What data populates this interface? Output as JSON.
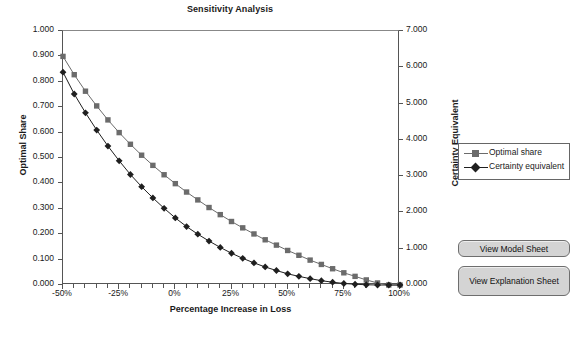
{
  "chart": {
    "title": "Sensitivity Analysis",
    "x_axis_title": "Percentage Increase in Loss",
    "y_axis_title_left": "Optimal Share",
    "y_axis_title_right": "Certainty Equivalent"
  },
  "legend": {
    "items": [
      {
        "label": "Optimal share",
        "marker": "square-marker",
        "color": "#6b6b6b"
      },
      {
        "label": "Certainty equivalent",
        "marker": "diamond-marker",
        "color": "#1f1f1f"
      }
    ]
  },
  "buttons": {
    "model_sheet": "View Model Sheet",
    "explanation_sheet": "View Explanation Sheet"
  },
  "chart_data": {
    "type": "line",
    "title": "Sensitivity Analysis",
    "xlabel": "Percentage Increase in Loss",
    "ylabel": "Optimal Share",
    "ylabel_secondary": "Certainty Equivalent",
    "grid": false,
    "legend_position": "right",
    "xlim": [
      -50,
      100
    ],
    "xtick_step": 25,
    "xtick_labels": [
      "-50%",
      "-25%",
      "0%",
      "25%",
      "50%",
      "75%",
      "100%"
    ],
    "xtick_values": [
      -50,
      -25,
      0,
      25,
      50,
      75,
      100
    ],
    "minor_tick_step": 5,
    "ylim": [
      0.0,
      1.0
    ],
    "ytick_step": 0.1,
    "ytick_labels": [
      "0.000",
      "0.100",
      "0.200",
      "0.300",
      "0.400",
      "0.500",
      "0.600",
      "0.700",
      "0.800",
      "0.900",
      "1.000"
    ],
    "ylim_secondary": [
      0.0,
      7.0
    ],
    "ytick_step_secondary": 1.0,
    "ytick_labels_secondary": [
      "0.000",
      "1.000",
      "2.000",
      "3.000",
      "4.000",
      "5.000",
      "6.000",
      "7.000"
    ],
    "x": [
      -50,
      -45,
      -40,
      -35,
      -30,
      -25,
      -20,
      -15,
      -10,
      -5,
      0,
      5,
      10,
      15,
      20,
      25,
      30,
      35,
      40,
      45,
      50,
      55,
      60,
      65,
      70,
      75,
      80,
      85,
      90,
      95,
      100
    ],
    "series": [
      {
        "name": "Optimal share",
        "axis": "left",
        "color": "#6b6b6b",
        "marker": "square",
        "values": [
          0.9,
          0.828,
          0.763,
          0.705,
          0.65,
          0.6,
          0.554,
          0.511,
          0.471,
          0.434,
          0.399,
          0.366,
          0.335,
          0.305,
          0.277,
          0.25,
          0.225,
          0.201,
          0.178,
          0.157,
          0.136,
          0.117,
          0.098,
          0.081,
          0.064,
          0.048,
          0.034,
          0.02,
          0.008,
          0.0,
          0.0
        ]
      },
      {
        "name": "Certainty equivalent",
        "axis": "right",
        "color": "#1f1f1f",
        "marker": "diamond",
        "values": [
          5.866,
          5.264,
          4.746,
          4.27,
          3.829,
          3.423,
          3.045,
          2.709,
          2.401,
          2.114,
          1.848,
          1.61,
          1.4,
          1.211,
          1.036,
          0.875,
          0.735,
          0.609,
          0.497,
          0.399,
          0.308,
          0.238,
          0.175,
          0.119,
          0.077,
          0.042,
          0.021,
          0.007,
          0.0,
          0.0,
          0.0
        ]
      }
    ]
  }
}
